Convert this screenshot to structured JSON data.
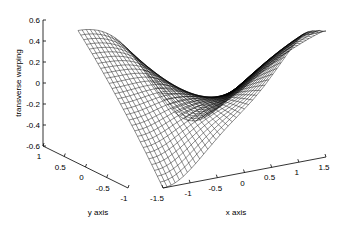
{
  "chart_data": {
    "type": "surface",
    "title": "",
    "xlabel": "x axis",
    "ylabel": "y axis",
    "zlabel": "transverse warping",
    "x_ticks": [
      "-1.5",
      "-1",
      "-0.5",
      "0",
      "0.5",
      "1",
      "1.5"
    ],
    "y_ticks": [
      "1",
      "0.5",
      "0",
      "-0.5",
      "-1"
    ],
    "z_ticks": [
      "0.6",
      "0.4",
      "0.2",
      "0",
      "-0.2",
      "-0.4",
      "-0.6"
    ],
    "xlim": [
      -1.5,
      1.5
    ],
    "ylim": [
      -1,
      1
    ],
    "zlim": [
      -0.6,
      0.6
    ],
    "grid": false,
    "mesh": {
      "nx": 40,
      "ny": 30,
      "color": "#000000"
    }
  }
}
